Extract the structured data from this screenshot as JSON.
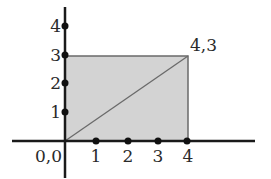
{
  "diagram": {
    "type": "coordinate-plane",
    "colors": {
      "axis": "#1a1a1a",
      "rect_fill": "#d3d3d3",
      "rect_stroke": "#6a6a6a",
      "diagonal": "#6a6a6a",
      "dot": "#111111",
      "label": "#2a2a2a"
    },
    "origin_label": "0,0",
    "corner_label": "4,3",
    "x_ticks": [
      "1",
      "2",
      "3",
      "4"
    ],
    "y_ticks": [
      "1",
      "2",
      "3",
      "4"
    ],
    "rectangle": {
      "x0": 0,
      "y0": 0,
      "x1": 4,
      "y1": 3
    },
    "diagonal": {
      "from": [
        0,
        0
      ],
      "to": [
        4,
        3
      ]
    }
  }
}
